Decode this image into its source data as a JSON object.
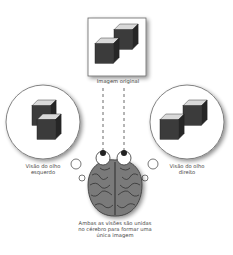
{
  "diagram": {
    "original_image_label": "Imagem original",
    "left_eye_view_label_line1": "Visão do olho",
    "left_eye_view_label_line2": "esquerdo",
    "right_eye_view_label_line1": "Visão do olho",
    "right_eye_view_label_line2": "direito",
    "brain_caption_line1": "Ambas as visões são unidas",
    "brain_caption_line2": "no cérebro para formar uma",
    "brain_caption_line3": "única imagem",
    "icons": [
      "cube-pair-icon",
      "brain-icon",
      "eye-icon",
      "thought-bubble-icon"
    ],
    "colors": {
      "cube_side": "#2e2e2e",
      "cube_front": "#3a3a3a",
      "cube_top": "#d8d8d8",
      "outline": "#555555",
      "brain": "#6a6a6a"
    }
  }
}
